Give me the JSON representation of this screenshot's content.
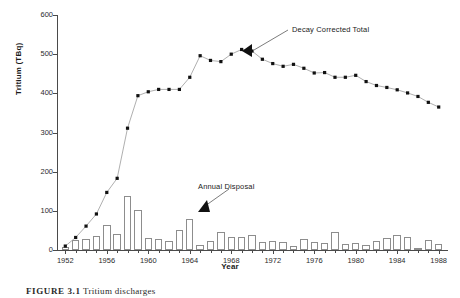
{
  "figure": {
    "caption_prefix": "FIGURE 3.1",
    "caption_text": "Tritium discharges",
    "y_axis_title": "Tritium (TBq)",
    "x_axis_title": "Year"
  },
  "annotations": {
    "decay_corrected": "Decay Corrected Total",
    "annual_disposal": "Annual Disposal"
  },
  "colors": {
    "marker": "#111111",
    "line": "#9a9a9a",
    "bar_stroke": "#8d8d8d",
    "axis": "#4a4a4a",
    "text": "#1a1a1a",
    "background": "#ffffff"
  },
  "axes": {
    "y_ticks": [
      "0",
      "100",
      "200",
      "300",
      "400",
      "500",
      "600"
    ],
    "y_tick_values": [
      0,
      100,
      200,
      300,
      400,
      500,
      600
    ],
    "ylim": [
      0,
      600
    ],
    "x_ticks": [
      "1952",
      "1956",
      "1960",
      "1964",
      "1968",
      "1972",
      "1976",
      "1980",
      "1984",
      "1988"
    ],
    "x_tick_values": [
      1952,
      1956,
      1960,
      1964,
      1968,
      1972,
      1976,
      1980,
      1984,
      1988
    ],
    "xlim": [
      1951.2,
      1988.8
    ]
  },
  "chart_data": {
    "type": "bar",
    "title": "",
    "xlabel": "Year",
    "ylabel": "Tritium (TBq)",
    "ylim": [
      0,
      600
    ],
    "xlim": [
      1951.2,
      1988.8
    ],
    "grid": false,
    "legend": "annotations-with-arrows",
    "categories": [
      1952,
      1953,
      1954,
      1955,
      1956,
      1957,
      1958,
      1959,
      1960,
      1961,
      1962,
      1963,
      1964,
      1965,
      1966,
      1967,
      1968,
      1969,
      1970,
      1971,
      1972,
      1973,
      1974,
      1975,
      1976,
      1977,
      1978,
      1979,
      1980,
      1981,
      1982,
      1983,
      1984,
      1985,
      1986,
      1987,
      1988
    ],
    "series": [
      {
        "name": "Annual Disposal",
        "type": "bar",
        "values": [
          8,
          26,
          29,
          36,
          65,
          42,
          137,
          101,
          31,
          27,
          22,
          51,
          79,
          13,
          24,
          46,
          34,
          34,
          38,
          20,
          23,
          21,
          10,
          27,
          20,
          17,
          47,
          16,
          17,
          14,
          22,
          31,
          39,
          33,
          6,
          26,
          16
        ]
      },
      {
        "name": "Decay Corrected Total",
        "type": "line",
        "marker": "square",
        "values": [
          10,
          32,
          61,
          92,
          147,
          183,
          311,
          394,
          404,
          410,
          410,
          410,
          441,
          496,
          484,
          481,
          500,
          512,
          508,
          487,
          476,
          469,
          474,
          464,
          452,
          453,
          441,
          441,
          446,
          430,
          420,
          415,
          409,
          401,
          392,
          377,
          365
        ]
      }
    ]
  }
}
